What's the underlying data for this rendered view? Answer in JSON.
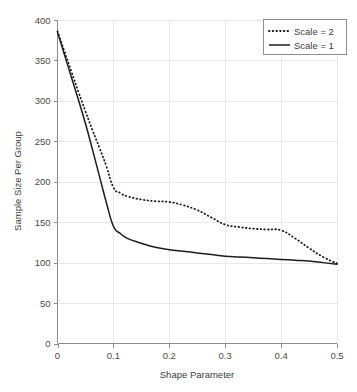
{
  "chart_data": {
    "type": "line",
    "title": "",
    "xlabel": "Shape Parameter",
    "ylabel": "Sample Size Per Group",
    "xlim": [
      0,
      0.5
    ],
    "ylim": [
      0,
      400
    ],
    "grid": true,
    "legend_position": "top-right",
    "xticks": [
      "0",
      "0.1",
      "0.2",
      "0.3",
      "0.4",
      "0.5"
    ],
    "xtick_values": [
      0,
      0.1,
      0.2,
      0.3,
      0.4,
      0.5
    ],
    "yticks": [
      "0",
      "50",
      "100",
      "150",
      "200",
      "250",
      "300",
      "350",
      "400"
    ],
    "ytick_values": [
      0,
      50,
      100,
      150,
      200,
      250,
      300,
      350,
      400
    ],
    "x": [
      0,
      0.0125,
      0.025,
      0.0375,
      0.05,
      0.0625,
      0.075,
      0.0875,
      0.1,
      0.1125,
      0.125,
      0.15,
      0.175,
      0.2,
      0.225,
      0.25,
      0.275,
      0.3,
      0.325,
      0.35,
      0.375,
      0.4,
      0.425,
      0.45,
      0.475,
      0.5
    ],
    "series": [
      {
        "name": "Scale = 2",
        "style": "dotted",
        "color": "#1c1c1c",
        "values": [
          386,
          361,
          336,
          311,
          287,
          264,
          242,
          219,
          193,
          186,
          182,
          178,
          176,
          175,
          171,
          165,
          156,
          147,
          144,
          142,
          141,
          140,
          130,
          118,
          107,
          99
        ]
      },
      {
        "name": "Scale = 1",
        "style": "solid",
        "color": "#1c1c1c",
        "values": [
          385,
          357,
          329,
          301,
          272,
          240,
          207,
          174,
          145,
          136,
          130,
          124,
          119,
          116,
          114,
          112,
          110,
          108,
          107,
          106,
          105,
          104,
          103,
          102,
          100,
          98
        ]
      }
    ]
  },
  "legend": {
    "entries": [
      {
        "label": "Scale = 2",
        "style": "dotted"
      },
      {
        "label": "Scale = 1",
        "style": "solid"
      }
    ]
  }
}
